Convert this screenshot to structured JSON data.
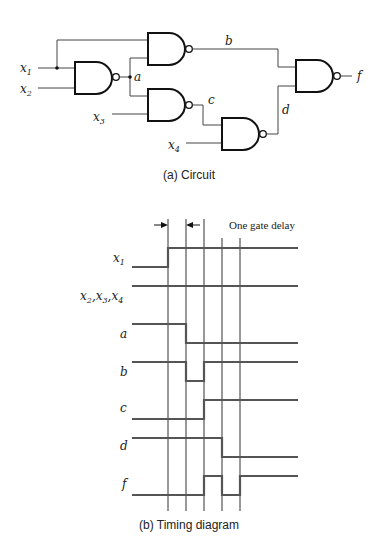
{
  "circuit": {
    "caption": "(a) Circuit",
    "inputs": [
      {
        "name": "x",
        "sub": "1"
      },
      {
        "name": "x",
        "sub": "2"
      },
      {
        "name": "x",
        "sub": "3"
      },
      {
        "name": "x",
        "sub": "4"
      }
    ],
    "nodes": {
      "a": "a",
      "b": "b",
      "c": "c",
      "d": "d",
      "f": "f"
    },
    "gate_type": "NAND"
  },
  "timing": {
    "caption": "(b) Timing diagram",
    "delay_label": "One gate delay",
    "signals": [
      {
        "label": "x",
        "sub": "1",
        "waveform": [
          0,
          1,
          1,
          1,
          1,
          1
        ]
      },
      {
        "label": "x2,x3,x4",
        "waveform": [
          1,
          1,
          1,
          1,
          1,
          1
        ]
      },
      {
        "label": "a",
        "waveform": [
          1,
          1,
          0,
          0,
          0,
          0
        ]
      },
      {
        "label": "b",
        "waveform": [
          1,
          1,
          0,
          1,
          1,
          1
        ]
      },
      {
        "label": "c",
        "waveform": [
          0,
          0,
          0,
          1,
          1,
          1
        ]
      },
      {
        "label": "d",
        "waveform": [
          1,
          1,
          1,
          1,
          0,
          0
        ]
      },
      {
        "label": "f",
        "waveform": [
          0,
          0,
          0,
          1,
          0,
          1
        ]
      }
    ]
  }
}
